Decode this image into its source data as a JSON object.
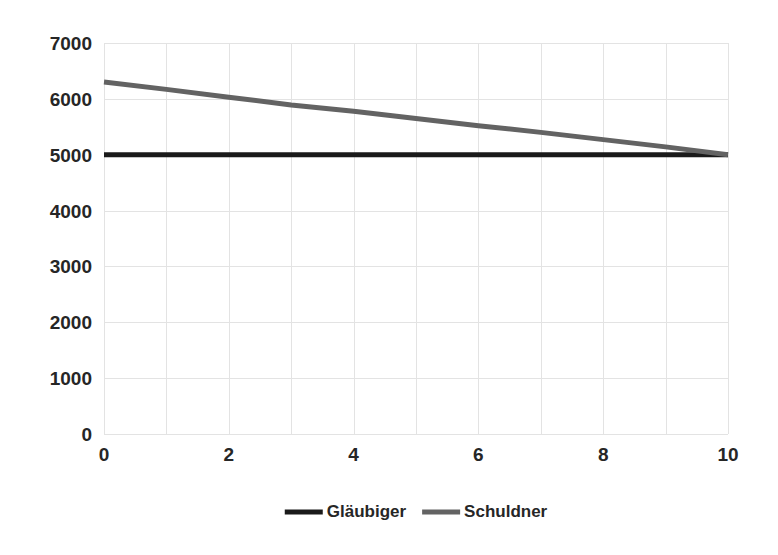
{
  "chart_data": {
    "type": "line",
    "title": "",
    "subtitle": "",
    "xlabel": "",
    "ylabel": "",
    "xlim": [
      0,
      10
    ],
    "ylim": [
      0,
      7000
    ],
    "grid": true,
    "legend_position": "bottom",
    "x_ticks": [
      "0",
      "2",
      "4",
      "6",
      "8",
      "10"
    ],
    "x_tick_values": [
      0,
      2,
      4,
      6,
      8,
      10
    ],
    "y_ticks": [
      "0",
      "1000",
      "2000",
      "3000",
      "4000",
      "5000",
      "6000",
      "7000"
    ],
    "y_tick_values": [
      0,
      1000,
      2000,
      3000,
      4000,
      5000,
      6000,
      7000
    ],
    "x": [
      0,
      1,
      2,
      3,
      4,
      5,
      6,
      7,
      8,
      9,
      10
    ],
    "series": [
      {
        "name": "Gläubiger",
        "color": "#1a1a1a",
        "width": 5,
        "values": [
          5000,
          5000,
          5000,
          5000,
          5000,
          5000,
          5000,
          5000,
          5000,
          5000,
          5000
        ]
      },
      {
        "name": "Schuldner",
        "color": "#636363",
        "width": 5,
        "values": [
          6300,
          6170,
          6030,
          5890,
          5780,
          5650,
          5520,
          5400,
          5270,
          5140,
          5000
        ]
      }
    ]
  },
  "legend": {
    "items": [
      {
        "label": "Gläubiger",
        "color": "#1a1a1a"
      },
      {
        "label": "Schuldner",
        "color": "#636363"
      }
    ]
  },
  "axes": {
    "grid_color": "#e3e3e3",
    "plot_background": "#ffffff"
  }
}
